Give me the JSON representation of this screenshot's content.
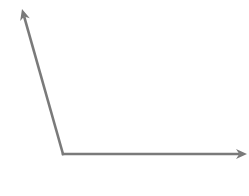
{
  "diagram": {
    "type": "axes-angle",
    "stroke_color": "#7a7a7a",
    "background": "#ffffff",
    "vertex": {
      "x": 63,
      "y": 154
    },
    "rays": [
      {
        "name": "upper-left-ray",
        "tip": {
          "x": 22,
          "y": 9
        }
      },
      {
        "name": "horizontal-ray",
        "tip": {
          "x": 247,
          "y": 154
        }
      }
    ]
  }
}
